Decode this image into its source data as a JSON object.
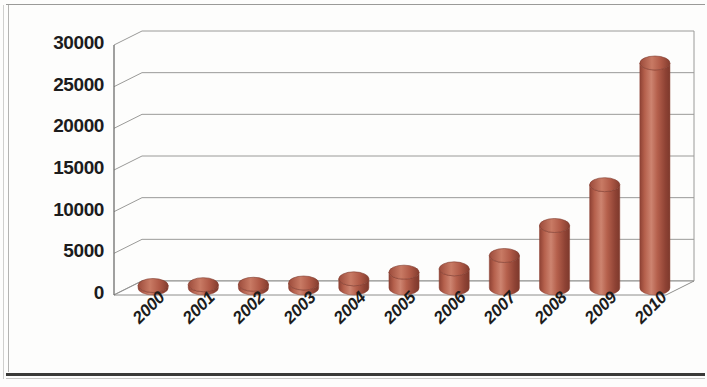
{
  "chart_data": {
    "type": "bar",
    "style": "3d-cylinder",
    "title": "",
    "subtitle": "",
    "xlabel": "",
    "ylabel": "",
    "categories": [
      "2000",
      "2001",
      "2002",
      "2003",
      "2004",
      "2005",
      "2006",
      "2007",
      "2008",
      "2009",
      "2010"
    ],
    "values": [
      300,
      400,
      450,
      600,
      1100,
      1900,
      2300,
      3900,
      7500,
      12400,
      27000
    ],
    "series": [
      {
        "name": "Series 1",
        "values": [
          300,
          400,
          450,
          600,
          1100,
          1900,
          2300,
          3900,
          7500,
          12400,
          27000
        ]
      }
    ],
    "ylim": [
      0,
      30000
    ],
    "ytick_values": [
      0,
      5000,
      10000,
      15000,
      20000,
      25000,
      30000
    ],
    "ytick_labels": [
      "0",
      "5000",
      "10000",
      "15000",
      "20000",
      "25000",
      "30000"
    ],
    "xtick_labels": [
      "2000",
      "2001",
      "2002",
      "2003",
      "2004",
      "2005",
      "2006",
      "2007",
      "2008",
      "2009",
      "2010"
    ],
    "grid": true,
    "grid_axis": "y",
    "legend": false,
    "legend_position": "none",
    "bar_color": "#b5604c",
    "bar_color_light": "#cd8470",
    "bar_color_dark": "#8e4234",
    "grid_color": "#9a9a98",
    "axis_color": "#8e8e8c",
    "background": "#fdfdfc",
    "text_color": "#1c1c1c",
    "xtick_rotation": -45
  },
  "axis": {
    "y_labels": [
      "30000",
      "25000",
      "20000",
      "15000",
      "10000",
      "5000",
      "0"
    ],
    "x_labels": [
      "2000",
      "2001",
      "2002",
      "2003",
      "2004",
      "2005",
      "2006",
      "2007",
      "2008",
      "2009",
      "2010"
    ]
  }
}
